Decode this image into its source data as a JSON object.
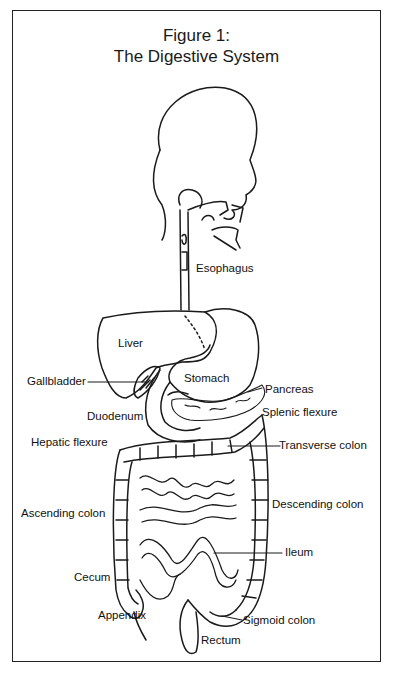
{
  "figure": {
    "title_line1": "Figure 1:",
    "title_line2": "The Digestive System"
  },
  "labels": {
    "esophagus": "Esophagus",
    "liver": "Liver",
    "gallbladder": "Gallbladder",
    "stomach": "Stomach",
    "pancreas": "Pancreas",
    "duodenum": "Duodenum",
    "splenic_flexure": "Splenic flexure",
    "hepatic_flexure": "Hepatic flexure",
    "transverse_colon": "Transverse colon",
    "ascending_colon": "Ascending colon",
    "descending_colon": "Descending colon",
    "ileum": "Ileum",
    "cecum": "Cecum",
    "appendix": "Appendix",
    "sigmoid_colon": "Sigmoid colon",
    "rectum": "Rectum"
  },
  "colors": {
    "line": "#1a1a1a",
    "background": "#ffffff"
  }
}
